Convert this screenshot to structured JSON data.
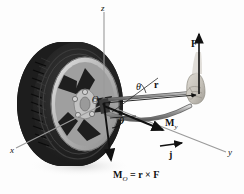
{
  "figure": {
    "type": "engineering-mechanics-diagram",
    "background_color": "#fdfdfd"
  },
  "axes": {
    "x": {
      "label": "x",
      "color": "#8a8a8a"
    },
    "y": {
      "label": "y",
      "color": "#8a8a8a"
    },
    "z": {
      "label": "z",
      "color": "#8a8a8a"
    }
  },
  "origin": {
    "label": "O"
  },
  "angles": [
    {
      "name": "theta-upper",
      "label": "θ"
    },
    {
      "name": "theta-lower",
      "label": "θ"
    }
  ],
  "vectors": [
    {
      "name": "force",
      "label": "F",
      "subscript": "",
      "color": "#1a1a1a"
    },
    {
      "name": "position",
      "label": "r",
      "subscript": "",
      "color": "#1a1a1a"
    },
    {
      "name": "moment-y",
      "label": "M",
      "subscript": "y",
      "color": "#1a1a1a"
    },
    {
      "name": "unit-vector-j",
      "label": "j",
      "subscript": "",
      "color": "#1a1a1a"
    }
  ],
  "equation": {
    "lhs": "M",
    "lhs_subscript": "O",
    "equals": "=",
    "rhs_r": "r",
    "cross": "×",
    "rhs_f": "F"
  },
  "objects": {
    "tire": {
      "name": "tire",
      "color": "#2a2a2a"
    },
    "wheel_rim": {
      "name": "alloy-wheel-rim",
      "color": "#b9b9b9",
      "spokes": 5,
      "lug_nuts": 5
    },
    "wrench": {
      "name": "lug-wrench-bar",
      "color": "#8f8f8f"
    },
    "hand": {
      "name": "hand-gripping-wrench",
      "color": "#c8c4bd"
    }
  }
}
